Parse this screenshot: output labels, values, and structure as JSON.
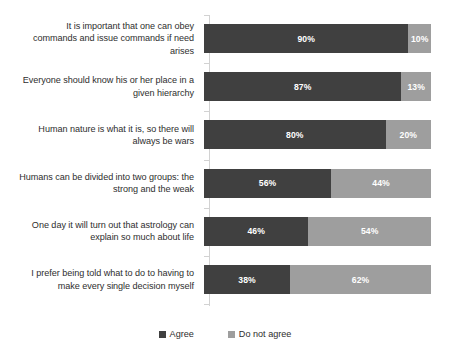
{
  "chart_data": {
    "type": "bar",
    "subtype": "stacked-horizontal-100pct",
    "title": "",
    "xlabel": "",
    "ylabel": "",
    "xlim": [
      0,
      100
    ],
    "grid": false,
    "legend_position": "bottom-center",
    "categories": [
      "It is important that one can obey\ncommands and issue commands if need\narises",
      "Everyone should know his or her place in a\ngiven hierarchy",
      "Human nature is what it is, so there will\nalways be wars",
      "Humans can be divided into two groups: the\nstrong and the weak",
      "One day it will turn out that astrology can\nexplain so much about life",
      "I prefer being told what to do to having to\nmake every single decision myself"
    ],
    "series": [
      {
        "name": "Agree",
        "color": "#404040",
        "values": [
          90,
          87,
          80,
          56,
          46,
          38
        ],
        "labels": [
          "90%",
          "87%",
          "80%",
          "56%",
          "46%",
          "38%"
        ]
      },
      {
        "name": "Do not agree",
        "color": "#9e9e9e",
        "values": [
          10,
          13,
          20,
          44,
          54,
          62
        ],
        "labels": [
          "10%",
          "13%",
          "20%",
          "44%",
          "54%",
          "62%"
        ]
      }
    ]
  },
  "legend": {
    "items": [
      {
        "label": "Agree",
        "color": "#404040"
      },
      {
        "label": "Do not agree",
        "color": "#9e9e9e"
      }
    ]
  },
  "colors": {
    "agree": "#404040",
    "do_not_agree": "#9e9e9e",
    "axis": "#d2d2d2",
    "label_text": "#2e2e2e",
    "value_text": "#ffffff",
    "background": "#ffffff"
  }
}
